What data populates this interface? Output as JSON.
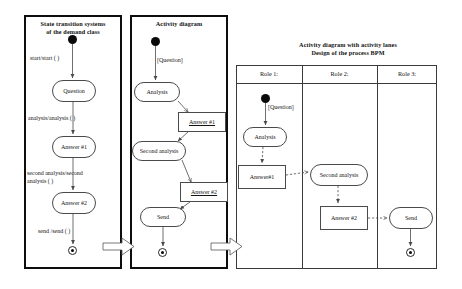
{
  "panels": [
    {
      "id": "state-transition",
      "title": "State transition systems\nof the demand class",
      "nodes": [
        {
          "name": "initial-state",
          "label": ""
        },
        {
          "name": "state-question",
          "label": "Question"
        },
        {
          "name": "state-answer-1",
          "label": "Answer  #1"
        },
        {
          "name": "state-answer-2",
          "label": "Answer  #2"
        },
        {
          "name": "final-state",
          "label": ""
        }
      ],
      "transitions": [
        {
          "name": "transition-start",
          "label": "start/start ( )"
        },
        {
          "name": "transition-analysis",
          "label": "analysis/analysis ( )"
        },
        {
          "name": "transition-second-analysis",
          "label": "second analysis/second\nanalysis ( )"
        },
        {
          "name": "transition-send",
          "label": "send /send ( )"
        }
      ]
    },
    {
      "id": "activity-diagram",
      "title": "Activity diagram",
      "guard": "[Question]",
      "actions": [
        {
          "name": "action-analysis",
          "label": "Analysis"
        },
        {
          "name": "action-second-analysis",
          "label": "Second analysis"
        },
        {
          "name": "action-send",
          "label": "Send"
        }
      ],
      "objects": [
        {
          "name": "object-answer-1",
          "label": "Answer  #1"
        },
        {
          "name": "object-answer-2",
          "label": "Answer  #2"
        }
      ]
    },
    {
      "id": "swimlane-diagram",
      "title": "Activity diagram with activity lanes\nDesign of the process BPM",
      "guard": "[Question]",
      "lanes": [
        {
          "name": "lane-role-1",
          "label": "Role 1:"
        },
        {
          "name": "lane-role-2",
          "label": "Role 2:"
        },
        {
          "name": "lane-role-3",
          "label": "Role 3:"
        }
      ],
      "nodes": [
        {
          "name": "action-analysis",
          "label": "Analysis"
        },
        {
          "name": "object-answer-1",
          "label": "Answer#1"
        },
        {
          "name": "action-second-analysis",
          "label": "Second analysis"
        },
        {
          "name": "object-answer-2",
          "label": "Answer #2"
        },
        {
          "name": "action-send",
          "label": "Send"
        }
      ]
    }
  ],
  "flow_arrows": [
    {
      "name": "refinement-arrow-1",
      "label": ""
    },
    {
      "name": "refinement-arrow-2",
      "label": ""
    }
  ],
  "colors": {
    "stroke": "#4a4a4a",
    "panel_border": "#0d0d0d",
    "fill": "#ffffff",
    "text": "#151515"
  }
}
